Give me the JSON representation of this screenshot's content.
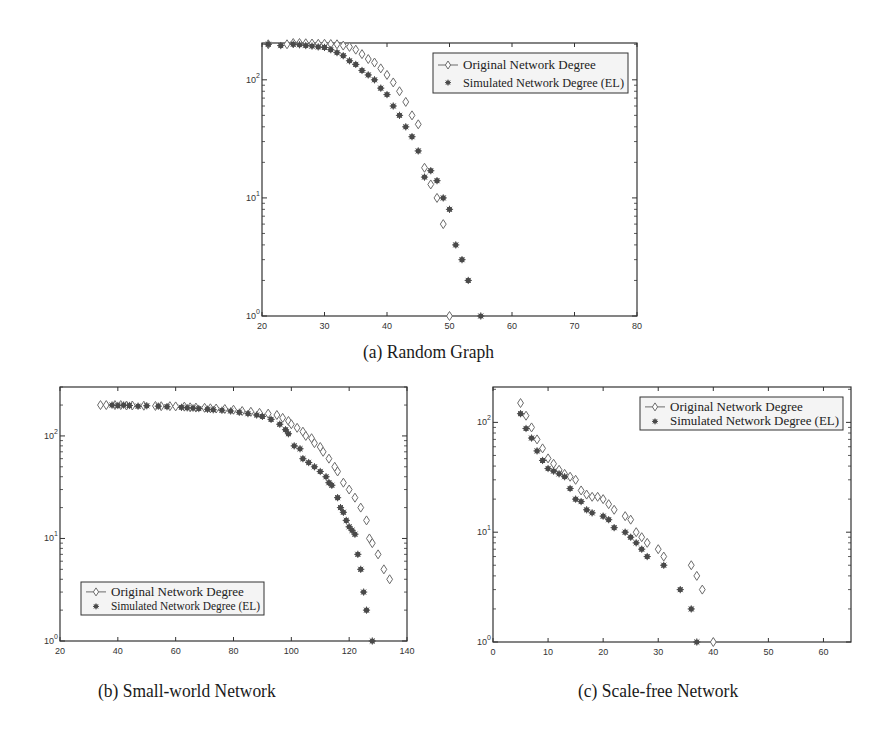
{
  "figure": {
    "captions": {
      "a": "(a) Random Graph",
      "b": "(b) Small-world Network",
      "c": "(c) Scale-free Network"
    },
    "colors": {
      "axis": "#333333",
      "original_marker": "#6b6b6b",
      "simulated_marker": "#4a4a4a",
      "legend_bg": "#f4f4f4",
      "background": "#ffffff"
    }
  },
  "chart_data": [
    {
      "id": "a",
      "type": "scatter",
      "title": "(a) Random Graph",
      "xlabel": "",
      "ylabel": "",
      "xscale": "linear",
      "yscale": "log",
      "xlim": [
        20,
        80
      ],
      "ylim": [
        1,
        205
      ],
      "xticks": [
        20,
        30,
        40,
        50,
        60,
        70,
        80
      ],
      "yticks": [
        "10^0",
        "10^1",
        "10^2"
      ],
      "grid": false,
      "legend_position": "upper right",
      "legend": [
        "Original Network Degree",
        "Simulated Network Degree (EL)"
      ],
      "series": [
        {
          "name": "Original Network Degree",
          "marker": "diamond-open",
          "x": [
            21,
            24,
            25,
            26,
            27,
            28,
            29,
            30,
            31,
            32,
            33,
            34,
            35,
            36,
            37,
            38,
            39,
            40,
            41,
            42,
            43,
            44,
            45,
            46,
            47,
            48,
            49,
            50
          ],
          "y": [
            200,
            200,
            205,
            205,
            204,
            203,
            202,
            202,
            201,
            200,
            195,
            190,
            180,
            165,
            150,
            140,
            125,
            110,
            95,
            80,
            65,
            50,
            42,
            18,
            13,
            10,
            6,
            1
          ]
        },
        {
          "name": "Simulated Network Degree (EL)",
          "marker": "asterisk-filled",
          "x": [
            21,
            23,
            25,
            26,
            27,
            28,
            29,
            30,
            31,
            32,
            33,
            34,
            35,
            36,
            37,
            38,
            39,
            40,
            41,
            42,
            43,
            44,
            45,
            46,
            47,
            48,
            49,
            50,
            51,
            52,
            53,
            55
          ],
          "y": [
            200,
            195,
            200,
            198,
            195,
            193,
            190,
            188,
            180,
            170,
            160,
            145,
            135,
            120,
            110,
            100,
            85,
            75,
            60,
            50,
            40,
            33,
            25,
            15,
            17,
            14,
            10,
            8,
            4,
            3,
            2,
            1
          ]
        }
      ]
    },
    {
      "id": "b",
      "type": "scatter",
      "title": "(b) Small-world Network",
      "xlabel": "",
      "ylabel": "",
      "xscale": "linear",
      "yscale": "log",
      "xlim": [
        20,
        140
      ],
      "ylim": [
        1,
        300
      ],
      "xticks": [
        20,
        40,
        60,
        80,
        100,
        120,
        140
      ],
      "yticks": [
        "10^0",
        "10^1",
        "10^2"
      ],
      "grid": false,
      "legend_position": "lower left",
      "legend": [
        "Original Network Degree",
        "Simulated Network Degree (EL)"
      ],
      "series": [
        {
          "name": "Original Network Degree",
          "marker": "diamond-open",
          "x": [
            34,
            36,
            39,
            41,
            43,
            45,
            49,
            53,
            55,
            58,
            60,
            63,
            65,
            67,
            70,
            72,
            74,
            77,
            80,
            83,
            86,
            89,
            92,
            95,
            97,
            99,
            100,
            102,
            104,
            105,
            107,
            108,
            110,
            111,
            113,
            115,
            116,
            118,
            120,
            122,
            124,
            126,
            127,
            128,
            130,
            132,
            134
          ],
          "y": [
            200,
            200,
            200,
            200,
            198,
            198,
            197,
            196,
            195,
            195,
            194,
            193,
            190,
            189,
            188,
            186,
            185,
            183,
            180,
            175,
            172,
            168,
            165,
            160,
            150,
            140,
            130,
            120,
            110,
            100,
            95,
            85,
            78,
            70,
            60,
            50,
            45,
            35,
            30,
            25,
            20,
            15,
            10,
            9,
            7,
            5,
            4
          ]
        },
        {
          "name": "Simulated Network Degree (EL)",
          "marker": "asterisk-filled",
          "x": [
            38,
            40,
            42,
            44,
            47,
            50,
            54,
            57,
            62,
            64,
            66,
            68,
            71,
            73,
            76,
            79,
            82,
            85,
            88,
            90,
            93,
            96,
            98,
            99,
            101,
            103,
            104,
            106,
            108,
            110,
            112,
            113,
            114,
            116,
            117,
            118,
            119,
            120,
            121,
            122,
            123,
            124,
            125,
            126,
            128
          ],
          "y": [
            200,
            198,
            200,
            198,
            195,
            197,
            195,
            193,
            190,
            188,
            187,
            185,
            182,
            180,
            178,
            175,
            170,
            165,
            160,
            155,
            145,
            130,
            115,
            105,
            80,
            75,
            60,
            55,
            50,
            45,
            40,
            35,
            33,
            25,
            20,
            18,
            15,
            13,
            12,
            11,
            7,
            5,
            3,
            2,
            1
          ]
        }
      ]
    },
    {
      "id": "c",
      "type": "scatter",
      "title": "(c) Scale-free Network",
      "xlabel": "",
      "ylabel": "",
      "xscale": "linear",
      "yscale": "log",
      "xlim": [
        0,
        65
      ],
      "ylim": [
        1,
        210
      ],
      "xticks": [
        0,
        10,
        20,
        30,
        40,
        50,
        60
      ],
      "yticks": [
        "10^0",
        "10^1",
        "10^2"
      ],
      "grid": false,
      "legend_position": "upper right",
      "legend": [
        "Original Network Degree",
        "Simulated Network Degree (EL)"
      ],
      "series": [
        {
          "name": "Original Network Degree",
          "marker": "diamond-open",
          "x": [
            5,
            6,
            7,
            8,
            9,
            10,
            11,
            12,
            13,
            14,
            15,
            16,
            17,
            18,
            19,
            20,
            21,
            22,
            24,
            25,
            26,
            27,
            28,
            30,
            31,
            36,
            37,
            38,
            40
          ],
          "y": [
            150,
            115,
            90,
            70,
            58,
            47,
            42,
            37,
            34,
            32,
            30,
            24,
            22,
            21,
            21,
            20,
            18,
            16,
            14,
            13,
            10,
            9,
            8,
            7,
            6,
            5,
            4,
            3,
            1
          ]
        },
        {
          "name": "Simulated Network Degree (EL)",
          "marker": "asterisk-filled",
          "x": [
            5,
            6,
            7,
            8,
            9,
            10,
            11,
            12,
            13,
            14,
            15,
            16,
            17,
            18,
            20,
            21,
            22,
            24,
            25,
            26,
            27,
            28,
            31,
            34,
            36,
            37
          ],
          "y": [
            120,
            88,
            72,
            55,
            45,
            38,
            36,
            34,
            32,
            25,
            20,
            19,
            16,
            15,
            14,
            13,
            11,
            10,
            9,
            8,
            7,
            6,
            5,
            3,
            2,
            1
          ]
        }
      ]
    }
  ]
}
